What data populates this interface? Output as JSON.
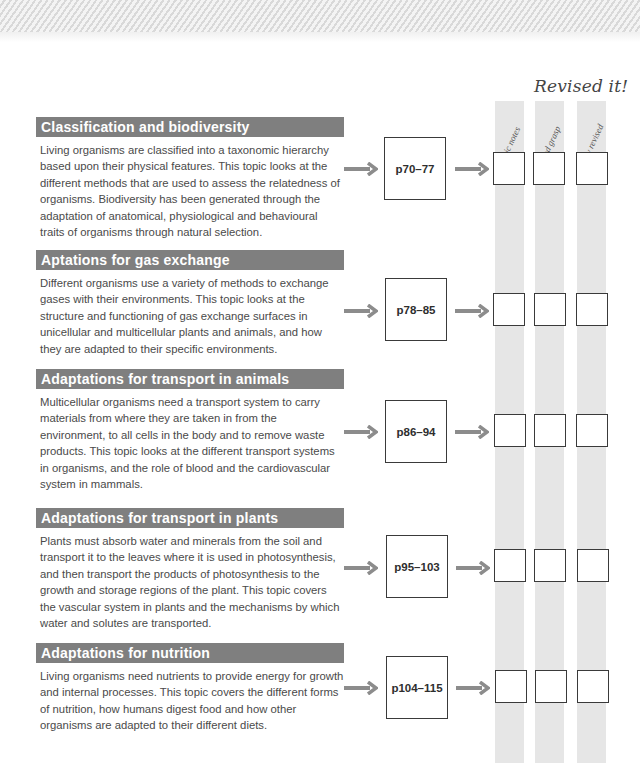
{
  "revised_panel": {
    "title": "Revised it!",
    "columns": [
      {
        "label": "Basic notes"
      },
      {
        "label": "Good grasp"
      },
      {
        "label": "Fully revised"
      }
    ]
  },
  "colors": {
    "header_bar": "#7f7f7f",
    "arrow": "#8c8c8c",
    "column_bg": "#e6e6e6",
    "box_border": "#3a3a3a"
  },
  "sections": [
    {
      "title": "Classification and biodiversity",
      "body": "Living organisms are classified into a taxonomic hierarchy based upon their physical features. This topic looks at the different methods that are used to assess the relatedness of organisms. Biodiversity has been generated through the adaptation of anatomical, physiological and behavioural traits of organisms through natural selection.",
      "pages": "p70–77"
    },
    {
      "title": "Aptations for gas exchange",
      "body": "Different organisms use a variety of methods to exchange gases with their environments. This topic looks at the structure and functioning of gas exchange surfaces in unicellular and multicellular plants and animals, and how they are adapted to their specific environments.",
      "pages": "p78–85"
    },
    {
      "title": "Adaptations for transport in animals",
      "body": "Multicellular organisms need a transport system to carry materials from where they are taken in from the environment, to all cells in the body and to remove waste products. This topic looks at the different transport systems in organisms, and the role of blood and the cardiovascular system in mammals.",
      "pages": "p86–94"
    },
    {
      "title": "Adaptations for transport in plants",
      "body": "Plants must absorb water and minerals from the soil and transport it to the leaves where it is used in photosynthesis, and then transport the products of photosynthesis to the growth and storage regions of the plant. This topic covers the vascular system in plants and the mechanisms by which water and solutes are transported.",
      "pages": "p95–103"
    },
    {
      "title": "Adaptations for nutrition",
      "body": "Living organisms need nutrients to provide energy for growth and internal processes. This topic covers the different forms of nutrition, how humans digest food and how other organisms are adapted to their different diets.",
      "pages": "p104–115"
    }
  ]
}
